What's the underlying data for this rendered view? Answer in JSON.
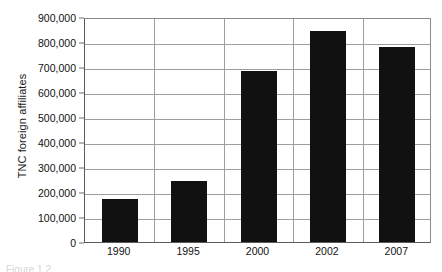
{
  "chart_data": {
    "type": "bar",
    "title": "",
    "subtitle": "",
    "xlabel": "",
    "ylabel": "TNC foreign affiliates",
    "categories": [
      "1990",
      "1995",
      "2000",
      "2002",
      "2007"
    ],
    "values": [
      172000,
      245000,
      685000,
      845000,
      782000
    ],
    "series": [
      {
        "name": "TNC foreign affiliates",
        "values": [
          172000,
          245000,
          685000,
          845000,
          782000
        ],
        "color": "#111111"
      }
    ],
    "ylim": [
      0,
      900000
    ],
    "ytick_values": [
      0,
      100000,
      200000,
      300000,
      400000,
      500000,
      600000,
      700000,
      800000,
      900000
    ],
    "ytick_labels": [
      "0",
      "100,000",
      "200,000",
      "300,000",
      "400,000",
      "500,000",
      "600,000",
      "700,000",
      "800,000",
      "900,000"
    ],
    "grid": "horizontal-and-vertical",
    "grid_color": "#9d9d9d",
    "legend": "none",
    "legend_position": "none",
    "plot_background": "#ffffff",
    "axis_color": "#5a5a5a",
    "bar_color": "#111111"
  },
  "figure": {
    "caption": "Figure 1.2"
  }
}
